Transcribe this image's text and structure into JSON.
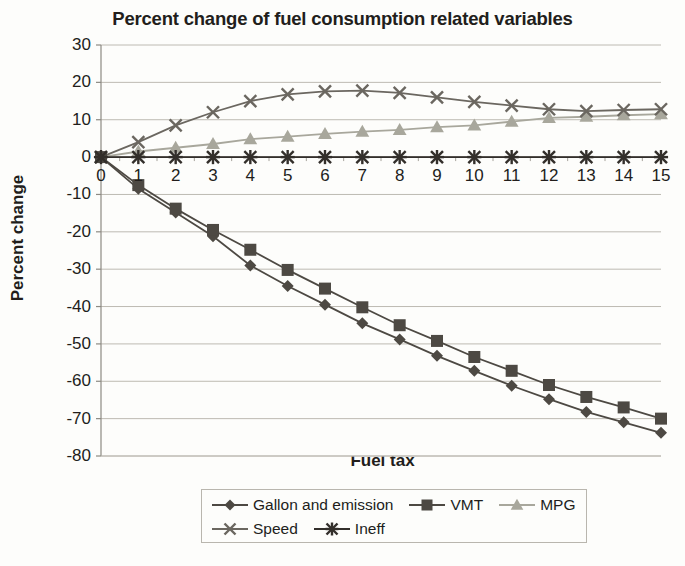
{
  "chart_data": {
    "type": "line",
    "title": "Percent change of fuel consumption related variables",
    "xlabel": "Fuel tax",
    "ylabel": "Percent change",
    "xlim": [
      0,
      15
    ],
    "ylim": [
      -80,
      30
    ],
    "ytick_labels": [
      "30",
      "20",
      "10",
      "0",
      "-10",
      "-20",
      "-30",
      "-40",
      "-50",
      "-60",
      "-70",
      "-80"
    ],
    "ytick_values": [
      30,
      20,
      10,
      0,
      -10,
      -20,
      -30,
      -40,
      -50,
      -60,
      -70,
      -80
    ],
    "xtick_labels": [
      "0",
      "1",
      "2",
      "3",
      "4",
      "5",
      "6",
      "7",
      "8",
      "9",
      "10",
      "11",
      "12",
      "13",
      "14",
      "15"
    ],
    "x": [
      0,
      1,
      2,
      3,
      4,
      5,
      6,
      7,
      8,
      9,
      10,
      11,
      12,
      13,
      14,
      15
    ],
    "grid": "horizontal",
    "legend_position": "bottom",
    "series": [
      {
        "name": "Gallon and emission",
        "marker": "diamond",
        "color": "#4d4943",
        "values": [
          0,
          -8.5,
          -14.8,
          -21.2,
          -29.0,
          -34.5,
          -39.5,
          -44.5,
          -48.8,
          -53.2,
          -57.2,
          -61.2,
          -64.8,
          -68.2,
          -71.0,
          -73.8
        ]
      },
      {
        "name": "VMT",
        "marker": "square",
        "color": "#4d4943",
        "values": [
          0,
          -7.5,
          -13.8,
          -19.5,
          -24.8,
          -30.2,
          -35.2,
          -40.2,
          -45.0,
          -49.2,
          -53.5,
          -57.2,
          -61.0,
          -64.2,
          -67.0,
          -70.0
        ]
      },
      {
        "name": "MPG",
        "marker": "triangle",
        "color": "#a8a79c",
        "values": [
          0,
          1.5,
          2.5,
          3.5,
          4.8,
          5.5,
          6.2,
          6.8,
          7.3,
          8.0,
          8.5,
          9.5,
          10.5,
          10.8,
          11.2,
          11.5
        ]
      },
      {
        "name": "Speed",
        "marker": "x",
        "color": "#6b6760",
        "values": [
          0,
          4.0,
          8.5,
          12.0,
          15.0,
          16.8,
          17.6,
          17.8,
          17.2,
          16.0,
          14.8,
          13.8,
          12.8,
          12.3,
          12.6,
          12.8
        ]
      },
      {
        "name": "Ineff",
        "marker": "asterisk",
        "color": "#332f2b",
        "values": [
          0,
          0,
          0,
          0,
          0,
          0,
          0,
          0,
          0,
          0,
          0,
          0,
          0,
          0,
          0,
          0
        ]
      }
    ]
  }
}
